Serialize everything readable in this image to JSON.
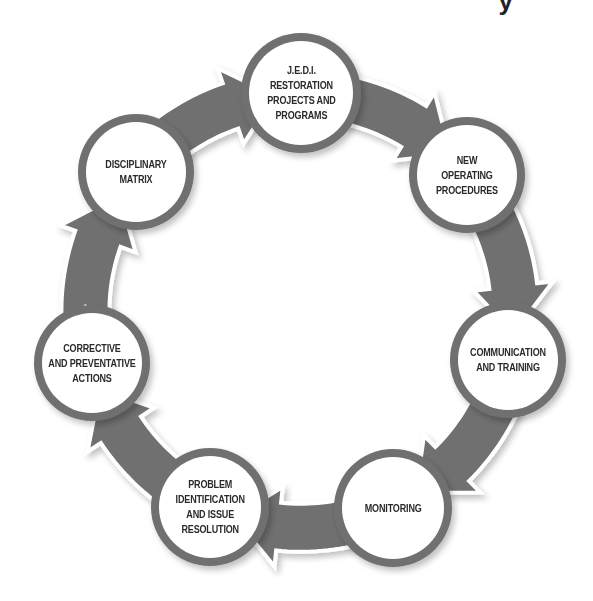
{
  "title_fragment": "y",
  "colors": {
    "arrow": "#6f6f6f",
    "ring": "#6f6f6f",
    "node_fill": "#ffffff",
    "text": "#2a2a2a",
    "background": "#ffffff"
  },
  "cycle": {
    "direction": "clockwise",
    "nodes": [
      {
        "id": "jedi",
        "lines": [
          "J.E.D.I.",
          "RESTORATION",
          "PROJECTS AND",
          "PROGRAMS"
        ],
        "cx": 301,
        "cy": 93,
        "r": 60
      },
      {
        "id": "new-operating-procedures",
        "lines": [
          "NEW",
          "OPERATING",
          "PROCEDURES"
        ],
        "cx": 467,
        "cy": 175,
        "r": 58
      },
      {
        "id": "communication-and-training",
        "lines": [
          "COMMUNICATION",
          "AND TRAINING"
        ],
        "cx": 508,
        "cy": 360,
        "r": 58
      },
      {
        "id": "monitoring",
        "lines": [
          "MONITORING"
        ],
        "cx": 393,
        "cy": 508,
        "r": 59
      },
      {
        "id": "problem-identification",
        "lines": [
          "PROBLEM",
          "IDENTIFICATION",
          "AND ISSUE",
          "RESOLUTION"
        ],
        "cx": 210,
        "cy": 507,
        "r": 59
      },
      {
        "id": "corrective-and-preventative-actions",
        "lines": [
          "CORRECTIVE",
          "AND PREVENTATIVE",
          "ACTIONS"
        ],
        "cx": 92,
        "cy": 363,
        "r": 58
      },
      {
        "id": "disciplinary-matrix",
        "lines": [
          "DISCIPLINARY",
          "MATRIX"
        ],
        "cx": 136,
        "cy": 172,
        "r": 58
      }
    ]
  }
}
